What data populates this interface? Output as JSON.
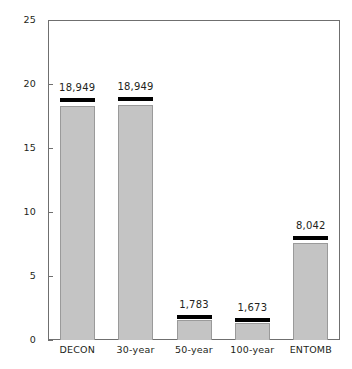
{
  "chart_data": {
    "type": "bar",
    "title": "",
    "xlabel": "",
    "ylabel": "Cubic meters",
    "ylim": [
      0,
      25
    ],
    "yticks": [
      0,
      5,
      10,
      15,
      20,
      25
    ],
    "ytick_labels": [
      "0",
      "5",
      "10",
      "15",
      "20",
      "25"
    ],
    "grid": false,
    "legend": "none",
    "categories": [
      "DECON",
      "30-year",
      "50-year",
      "100-year",
      "ENTOMB"
    ],
    "values": [
      18.3,
      18.35,
      1.55,
      1.3,
      7.55
    ],
    "data_labels": [
      "18,949",
      "18,949",
      "1,783",
      "1,673",
      "8,042"
    ],
    "bars": [
      {
        "category": "DECON",
        "label": "18,949",
        "value": 18.3,
        "cap_top": 18.9
      },
      {
        "category": "30-year",
        "label": "18,949",
        "value": 18.35,
        "cap_top": 18.95
      },
      {
        "category": "50-year",
        "label": "1,783",
        "value": 1.55,
        "cap_top": 1.95
      },
      {
        "category": "100-year",
        "label": "1,673",
        "value": 1.3,
        "cap_top": 1.7
      },
      {
        "category": "ENTOMB",
        "label": "8,042",
        "value": 7.55,
        "cap_top": 8.1
      }
    ],
    "colors": {
      "bar_fill": "#c4c4c4",
      "bar_border": "#9a9a9a",
      "bar_cap": "#000000",
      "axis": "#6f6f6f",
      "text": "#231f20",
      "background": "#ffffff"
    }
  }
}
